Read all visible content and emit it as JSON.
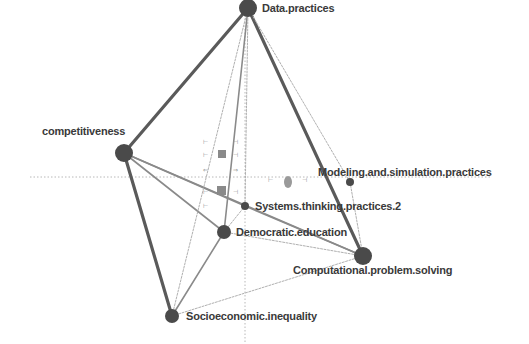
{
  "diagram": {
    "type": "network",
    "colors": {
      "node": "#4a4a4a",
      "edge_strong": "#5a5a5a",
      "edge_medium": "#8a8a8a",
      "edge_weak": "#b0b0b0",
      "label": "#3a3a3a",
      "axis": "#b8b8b8"
    },
    "nodes": [
      {
        "id": "data",
        "label": "Data.practices",
        "size": "large"
      },
      {
        "id": "competitiveness",
        "label": "competitiveness",
        "size": "large"
      },
      {
        "id": "modeling",
        "label": "Modeling.and.simulation.practices",
        "size": "small"
      },
      {
        "id": "systems",
        "label": "Systems.thinking.practices.2",
        "size": "small"
      },
      {
        "id": "democratic",
        "label": "Democratic.education",
        "size": "medium"
      },
      {
        "id": "computational",
        "label": "Computational.problem.solving",
        "size": "large"
      },
      {
        "id": "socioeconomic",
        "label": "Socioeconomic.inequality",
        "size": "medium"
      }
    ],
    "edges": [
      {
        "source": "data",
        "target": "competitiveness",
        "weight": "strong"
      },
      {
        "source": "data",
        "target": "computational",
        "weight": "strong"
      },
      {
        "source": "competitiveness",
        "target": "socioeconomic",
        "weight": "strong"
      },
      {
        "source": "competitiveness",
        "target": "computational",
        "weight": "medium"
      },
      {
        "source": "competitiveness",
        "target": "systems",
        "weight": "medium"
      },
      {
        "source": "competitiveness",
        "target": "democratic",
        "weight": "medium"
      },
      {
        "source": "data",
        "target": "democratic",
        "weight": "medium"
      },
      {
        "source": "data",
        "target": "socioeconomic",
        "weight": "weak"
      },
      {
        "source": "data",
        "target": "systems",
        "weight": "weak"
      },
      {
        "source": "data",
        "target": "modeling",
        "weight": "weak"
      },
      {
        "source": "democratic",
        "target": "socioeconomic",
        "weight": "medium"
      },
      {
        "source": "democratic",
        "target": "computational",
        "weight": "weak"
      },
      {
        "source": "democratic",
        "target": "systems",
        "weight": "weak"
      },
      {
        "source": "systems",
        "target": "computational",
        "weight": "medium"
      },
      {
        "source": "modeling",
        "target": "computational",
        "weight": "weak"
      },
      {
        "source": "socioeconomic",
        "target": "computational",
        "weight": "weak"
      }
    ]
  }
}
